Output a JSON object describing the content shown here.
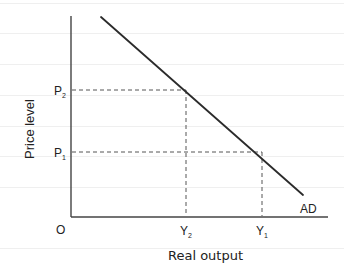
{
  "diagram": {
    "y_axis_label": "Price level",
    "x_axis_label": "Real output",
    "origin_label": "O",
    "curve_label": "AD",
    "price_levels": [
      {
        "label": "P",
        "sub": "2"
      },
      {
        "label": "P",
        "sub": "1"
      }
    ],
    "output_levels": [
      {
        "label": "Y",
        "sub": "2"
      },
      {
        "label": "Y",
        "sub": "1"
      }
    ],
    "points": [
      {
        "price": "P2",
        "output": "Y2"
      },
      {
        "price": "P1",
        "output": "Y1"
      }
    ],
    "colors": {
      "line": "#2b2b2b",
      "dashed": "#555555",
      "ruled": "#eeeeee"
    }
  }
}
